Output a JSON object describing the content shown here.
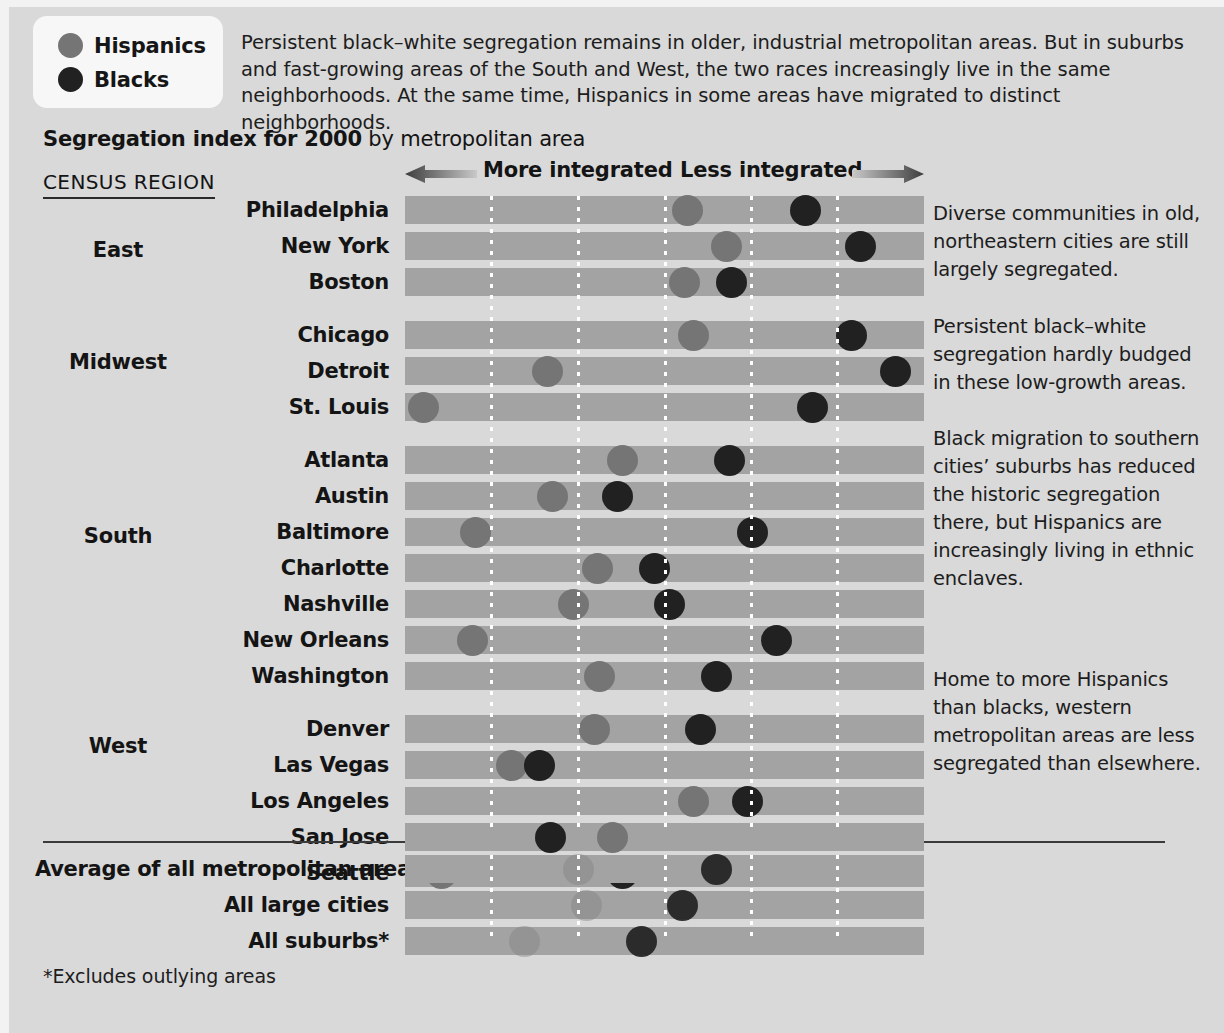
{
  "legend": {
    "items": [
      {
        "label": "Hispanics",
        "color": "#757575",
        "icon": "circle-icon"
      },
      {
        "label": "Blacks",
        "color": "#212121",
        "icon": "circle-icon"
      }
    ]
  },
  "intro": "Persistent black–white segregation remains in older, industrial metropolitan areas. But in suburbs and fast-growing areas of the South and West, the two races increasingly live in the same neighborhoods. At the same time, Hispanics in some areas have migrated to distinct neighborhoods.",
  "subtitle": {
    "strong": "Segregation index for 2000",
    "rest": " by metropolitan area"
  },
  "census_region_heading": "CENSUS REGION",
  "axis": {
    "left_label": "More integrated",
    "right_label": "Less integrated",
    "left_arrow_icon": "arrow-left-icon",
    "right_arrow_icon": "arrow-right-icon"
  },
  "regions": [
    {
      "name": "East"
    },
    {
      "name": "Midwest"
    },
    {
      "name": "South"
    },
    {
      "name": "West"
    }
  ],
  "notes": [
    "Diverse communities in old, northeastern cities are still largely segregated.",
    "Persistent black–white segregation hardly budged in these low-growth areas.",
    "Black migration to southern cities’ suburbs has reduced the historic segregation there, but Hispanics are increasingly living in ethnic enclaves.",
    "Home to more Hispanics than blacks, western metropolitan areas are less segregated than elsewhere."
  ],
  "footnote": "*Excludes outlying areas",
  "chart_data": {
    "type": "scatter",
    "title": "Segregation index for 2000 by metropolitan area",
    "xlabel": "Segregation index (dissimilarity index)",
    "ylabel": "Metropolitan area",
    "xlim": [
      0,
      100
    ],
    "grid": true,
    "grid_x": [
      16.6,
      33.3,
      50.0,
      66.6,
      83.3
    ],
    "legend_position": "top-left",
    "series": [
      {
        "name": "Hispanics",
        "color": "#757575"
      },
      {
        "name": "Blacks",
        "color": "#212121"
      }
    ],
    "groups": [
      {
        "region": "East",
        "rows": [
          {
            "category": "Philadelphia",
            "hispanics": 54.5,
            "blacks": 77.2
          },
          {
            "category": "New York",
            "hispanics": 62.0,
            "blacks": 87.8
          },
          {
            "category": "Boston",
            "hispanics": 53.8,
            "blacks": 63.0
          }
        ]
      },
      {
        "region": "Midwest",
        "rows": [
          {
            "category": "Chicago",
            "hispanics": 55.5,
            "blacks": 86.0
          },
          {
            "category": "Detroit",
            "hispanics": 27.5,
            "blacks": 94.5
          },
          {
            "category": "St. Louis",
            "hispanics": 3.5,
            "blacks": 78.5
          }
        ]
      },
      {
        "region": "South",
        "rows": [
          {
            "category": "Atlanta",
            "hispanics": 42.0,
            "blacks": 62.5
          },
          {
            "category": "Austin",
            "hispanics": 28.5,
            "blacks": 41.0
          },
          {
            "category": "Baltimore",
            "hispanics": 13.5,
            "blacks": 67.0
          },
          {
            "category": "Charlotte",
            "hispanics": 37.0,
            "blacks": 48.0
          },
          {
            "category": "Nashville",
            "hispanics": 32.5,
            "blacks": 51.0
          },
          {
            "category": "New Orleans",
            "hispanics": 13.0,
            "blacks": 71.5
          },
          {
            "category": "Washington",
            "hispanics": 37.5,
            "blacks": 60.0
          }
        ]
      },
      {
        "region": "West",
        "rows": [
          {
            "category": "Denver",
            "hispanics": 36.5,
            "blacks": 57.0
          },
          {
            "category": "Las Vegas",
            "hispanics": 20.5,
            "blacks": 26.0
          },
          {
            "category": "Los Angeles",
            "hispanics": 55.5,
            "blacks": 66.0
          },
          {
            "category": "San Jose",
            "hispanics": 40.0,
            "blacks": 28.0
          },
          {
            "category": "Seattle",
            "hispanics": 7.0,
            "blacks": 42.0
          }
        ]
      }
    ],
    "summary_rows": [
      {
        "category": "Average of all metropolitan areas",
        "hispanics": 33.5,
        "blacks": 60.0
      },
      {
        "category": "All large cities",
        "hispanics": 35.0,
        "blacks": 53.5
      },
      {
        "category": "All suburbs*",
        "hispanics": 23.0,
        "blacks": 45.5
      }
    ]
  }
}
